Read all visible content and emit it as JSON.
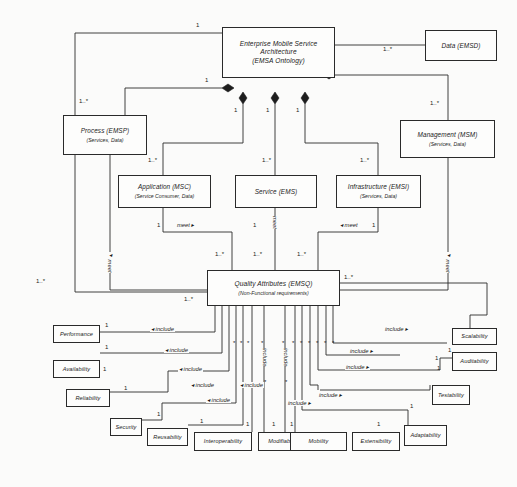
{
  "diagram": {
    "type": "uml-composition-diagram",
    "nodes": [
      {
        "id": "root",
        "title": "Enterprise Mobile Service",
        "title2": "Architecture",
        "subtitle": "(EMSA Ontology)"
      },
      {
        "id": "data",
        "title": "Data (EMSD)",
        "subtitle": ""
      },
      {
        "id": "process",
        "title": "Process (EMSP)",
        "subtitle": "(Services, Data)"
      },
      {
        "id": "management",
        "title": "Management (MSM)",
        "subtitle": "(Services, Data)"
      },
      {
        "id": "application",
        "title": "Application (MSC)",
        "subtitle": "(Service Consumer, Data)"
      },
      {
        "id": "service",
        "title": "Service (EMS)",
        "subtitle": ""
      },
      {
        "id": "infrastructure",
        "title": "Infrastructure (EMSI)",
        "subtitle": "(Services, Data)"
      },
      {
        "id": "quality",
        "title": "Quality Attributes (EMSQ)",
        "subtitle": "(Non-Functional requirements)"
      }
    ],
    "leaves": [
      {
        "id": "performance",
        "title": "Performance"
      },
      {
        "id": "availability",
        "title": "Availability"
      },
      {
        "id": "reliability",
        "title": "Reliability"
      },
      {
        "id": "security",
        "title": "Security"
      },
      {
        "id": "reusability",
        "title": "Reusability"
      },
      {
        "id": "interoperability",
        "title": "Interoperability"
      },
      {
        "id": "modifiability",
        "title": "Modifiability"
      },
      {
        "id": "mobility",
        "title": "Mobility"
      },
      {
        "id": "extensibility",
        "title": "Extensibility"
      },
      {
        "id": "adaptability",
        "title": "Adaptability"
      },
      {
        "id": "testability",
        "title": "Testability"
      },
      {
        "id": "auditability",
        "title": "Auditability"
      },
      {
        "id": "scalability",
        "title": "Scalability"
      }
    ],
    "multiplicities": {
      "one": "1",
      "many": "1..*"
    },
    "associations": {
      "meet_right": "meet ▸",
      "meet_left": "◂ meet",
      "meet": "meet",
      "include_right": "include ▸",
      "include_left": "◂ include",
      "include": "include",
      "star": "*"
    },
    "colors": {
      "stroke": "#2a2a2a",
      "background": "#fbfbfa",
      "node_fill": "#fdfdfc",
      "text": "#1a1a1a"
    }
  }
}
